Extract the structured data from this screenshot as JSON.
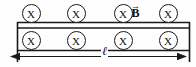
{
  "figure": {
    "stroke_color": "#1a1a1a",
    "background_color": "#ffffff",
    "field_symbol_glyph": "X",
    "field_symbols": [
      {
        "id": "top-1",
        "row": "top",
        "cx": 31,
        "cy": 13,
        "label": "X"
      },
      {
        "id": "top-2",
        "row": "top",
        "cx": 76,
        "cy": 13,
        "label": "X"
      },
      {
        "id": "top-3",
        "row": "top",
        "cx": 123,
        "cy": 13,
        "label": "X"
      },
      {
        "id": "top-4",
        "row": "top",
        "cx": 168,
        "cy": 13,
        "label": "X"
      },
      {
        "id": "bottom-1",
        "row": "bottom",
        "cx": 31,
        "cy": 40,
        "label": "X"
      },
      {
        "id": "bottom-2",
        "row": "bottom",
        "cx": 76,
        "cy": 40,
        "label": "X"
      },
      {
        "id": "bottom-3",
        "row": "bottom",
        "cx": 123,
        "cy": 40,
        "label": "X"
      },
      {
        "id": "bottom-4",
        "row": "bottom",
        "cx": 168,
        "cy": 40,
        "label": "X"
      }
    ],
    "b_field_label": {
      "symbol": "B",
      "vector_arrow": "→"
    },
    "length_label": {
      "symbol": "ℓ"
    }
  }
}
